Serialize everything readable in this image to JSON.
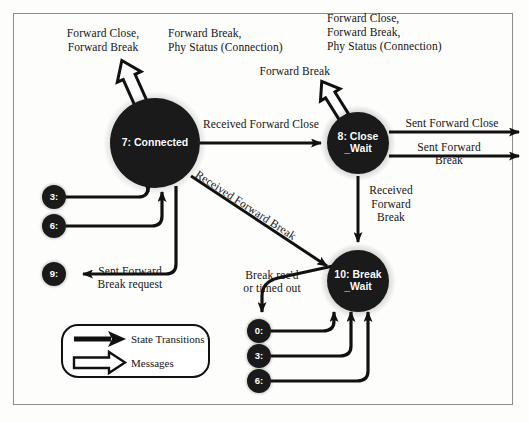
{
  "diagram": {
    "background_color": "#fdfdfc",
    "frame_color": "#8d8d8d",
    "node_fill": "#1a1a1a",
    "node_text_color": "#ffffff",
    "line_color": "#111111"
  },
  "states": [
    {
      "id": "state-7",
      "label": "7: Connected",
      "line1": "7: Connected",
      "line2": "",
      "cx": 155,
      "cy": 143,
      "r": 45
    },
    {
      "id": "state-8",
      "label": "8: Close_Wait",
      "line1": "8: Close",
      "line2": "_Wait",
      "cx": 358,
      "cy": 143,
      "r": 31
    },
    {
      "id": "state-10",
      "label": "10: Break_Wait",
      "line1": "10: Break",
      "line2": "_Wait",
      "cx": 358,
      "cy": 281,
      "r": 31
    }
  ],
  "mini_states": [
    {
      "id": "mini-3-left",
      "label": "3:",
      "cx": 54,
      "cy": 197,
      "r": 12
    },
    {
      "id": "mini-6-left",
      "label": "6:",
      "cx": 54,
      "cy": 226,
      "r": 12
    },
    {
      "id": "mini-9-left",
      "label": "9:",
      "cx": 54,
      "cy": 274,
      "r": 12
    },
    {
      "id": "mini-0-bottom",
      "label": "0:",
      "cx": 259,
      "cy": 331,
      "r": 12
    },
    {
      "id": "mini-3-bottom",
      "label": "3:",
      "cx": 259,
      "cy": 356,
      "r": 12
    },
    {
      "id": "mini-6-bottom",
      "label": "6:",
      "cx": 259,
      "cy": 381,
      "r": 12
    }
  ],
  "messages": [
    {
      "id": "msg-out-connected",
      "text": "Forward Close,\nForward Break",
      "direction": "outgoing",
      "attached_to": "7: Connected"
    },
    {
      "id": "msg-in-connected",
      "text": "Forward Break,\nPhy Status (Connection)",
      "direction": "incoming",
      "attached_to": "7: Connected"
    },
    {
      "id": "msg-out-closewait",
      "text": "Forward Break",
      "direction": "outgoing",
      "attached_to": "8: Close_Wait"
    },
    {
      "id": "msg-in-closewait",
      "text": "Forward Close,\nForward Break,\nPhy Status (Connection)",
      "direction": "incoming",
      "attached_to": "8: Close_Wait"
    }
  ],
  "transition_labels": [
    {
      "id": "t-recv-fwd-close",
      "text": "Received Forward Close"
    },
    {
      "id": "t-recv-fwd-break-diag",
      "text": "Received Forward Break"
    },
    {
      "id": "t-recv-fwd-break-vert",
      "text": "Received\nForward\nBreak"
    },
    {
      "id": "t-sent-fwd-close",
      "text": "Sent Forward Close"
    },
    {
      "id": "t-sent-fwd-break",
      "text": "Sent Forward\nBreak"
    },
    {
      "id": "t-sent-fwd-break-req",
      "text": "Sent Forward\nBreak request"
    },
    {
      "id": "t-break-recd",
      "text": "Break rec'd\nor timed out"
    }
  ],
  "legend": {
    "items": [
      {
        "id": "legend-state-transitions",
        "label": "State Transitions",
        "arrow": "solid-arrow-icon"
      },
      {
        "id": "legend-messages",
        "label": "Messages",
        "arrow": "hollow-arrow-icon"
      }
    ]
  }
}
